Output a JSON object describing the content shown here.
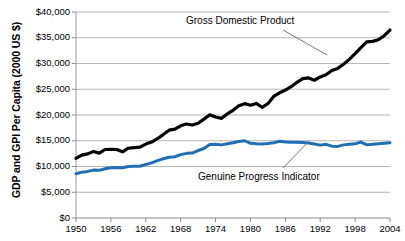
{
  "chart_data": {
    "type": "line",
    "title": "",
    "xlabel": "",
    "ylabel": "GDP and GPI Per Capita (2000 US $)",
    "xlim": [
      1950,
      2004
    ],
    "ylim": [
      0,
      40000
    ],
    "grid": true,
    "grid_axis": "y",
    "legend_position": "inline-annotations",
    "y_ticks": [
      0,
      5000,
      10000,
      15000,
      20000,
      25000,
      30000,
      35000,
      40000
    ],
    "y_tick_labels": [
      "$0",
      "$5,000",
      "$10,000",
      "$15,000",
      "$20,000",
      "$25,000",
      "$30,000",
      "$35,000",
      "$40,000"
    ],
    "x_ticks": [
      1950,
      1956,
      1962,
      1968,
      1974,
      1980,
      1986,
      1992,
      1998,
      2004
    ],
    "x_tick_labels": [
      "1950",
      "1956",
      "1962",
      "1968",
      "1974",
      "1980",
      "1986",
      "1992",
      "1998",
      "2004"
    ],
    "x": [
      1950,
      1951,
      1952,
      1953,
      1954,
      1955,
      1956,
      1957,
      1958,
      1959,
      1960,
      1961,
      1962,
      1963,
      1964,
      1965,
      1966,
      1967,
      1968,
      1969,
      1970,
      1971,
      1972,
      1973,
      1974,
      1975,
      1976,
      1977,
      1978,
      1979,
      1980,
      1981,
      1982,
      1983,
      1984,
      1985,
      1986,
      1987,
      1988,
      1989,
      1990,
      1991,
      1992,
      1993,
      1994,
      1995,
      1996,
      1997,
      1998,
      1999,
      2000,
      2001,
      2002,
      2003,
      2004
    ],
    "series": [
      {
        "name": "Gross Domestic Product",
        "color": "#000000",
        "line_width": 3.2,
        "values": [
          11600,
          12200,
          12450,
          12900,
          12600,
          13300,
          13350,
          13300,
          12850,
          13550,
          13650,
          13750,
          14350,
          14750,
          15400,
          16200,
          17050,
          17250,
          17900,
          18250,
          18050,
          18400,
          19200,
          20050,
          19600,
          19350,
          20200,
          20900,
          21800,
          22200,
          21900,
          22250,
          21500,
          22200,
          23600,
          24300,
          24850,
          25500,
          26350,
          27050,
          27200,
          26750,
          27400,
          27800,
          28650,
          29050,
          29850,
          30800,
          31900,
          33100,
          34200,
          34300,
          34600,
          35400,
          36500
        ],
        "annotation": {
          "text": "Gross Domestic Product",
          "text_x_px": 186,
          "text_y_px": 15,
          "leader_from": [
            283,
            30
          ],
          "leader_to": [
            327,
            55
          ]
        }
      },
      {
        "name": "Genuine Progress Indicator",
        "color": "#1F6FB5",
        "line_width": 3.0,
        "values": [
          8600,
          8900,
          9050,
          9300,
          9250,
          9550,
          9750,
          9800,
          9750,
          10000,
          10050,
          10050,
          10400,
          10700,
          11150,
          11500,
          11800,
          11900,
          12300,
          12550,
          12600,
          13100,
          13500,
          14250,
          14300,
          14200,
          14400,
          14600,
          14850,
          15000,
          14500,
          14400,
          14350,
          14450,
          14600,
          14900,
          14750,
          14700,
          14700,
          14650,
          14550,
          14350,
          14150,
          14300,
          13950,
          13900,
          14200,
          14300,
          14400,
          14750,
          14200,
          14300,
          14400,
          14500,
          14600
        ],
        "annotation": {
          "text": "Genuine Progress Indicator",
          "text_x_px": 198,
          "text_y_px": 171,
          "leader_from": [
            283,
            168
          ],
          "leader_to": [
            309,
            141
          ]
        }
      }
    ]
  },
  "axis": {
    "y_title": "GDP and GPI Per Capita (2000 US $)"
  }
}
